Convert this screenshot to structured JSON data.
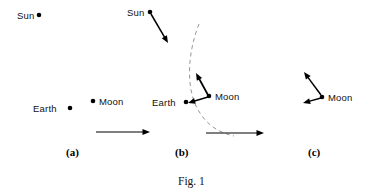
{
  "figure": {
    "caption": "Fig. 1"
  },
  "panels": [
    {
      "id": "a",
      "label": "(a)",
      "bodies": [
        {
          "name": "Sun",
          "label": "Sun",
          "label_side": "left",
          "x": 39,
          "y": 15,
          "label_x": 17,
          "label_y": 11
        },
        {
          "name": "Earth",
          "label": "Earth",
          "label_side": "left",
          "x": 70,
          "y": 108,
          "label_x": 33,
          "label_y": 104
        },
        {
          "name": "Moon",
          "label": "Moon",
          "label_side": "right",
          "x": 93,
          "y": 101,
          "label_x": 99,
          "label_y": 97
        }
      ],
      "vectors": [],
      "arc": null,
      "label_x": 66,
      "label_y": 147
    },
    {
      "id": "b",
      "label": "(b)",
      "bodies": [
        {
          "name": "Sun",
          "label": "Sun",
          "label_side": "left",
          "x": 150,
          "y": 12,
          "label_x": 127,
          "label_y": 8
        },
        {
          "name": "Earth",
          "label": "Earth",
          "label_side": "left",
          "x": 186,
          "y": 102,
          "label_x": 152,
          "label_y": 98
        },
        {
          "name": "Moon",
          "label": "Moon",
          "label_side": "right",
          "x": 209,
          "y": 96,
          "label_x": 215,
          "label_y": 92
        }
      ],
      "vectors": [
        {
          "name": "sun-force-vector",
          "x1": 151,
          "y1": 14,
          "x2": 168,
          "y2": 43,
          "width": 1.5
        },
        {
          "name": "moon-to-earth-vector",
          "x1": 208,
          "y1": 97,
          "x2": 188,
          "y2": 103,
          "width": 1.5
        },
        {
          "name": "moon-tangential-vector",
          "x1": 208,
          "y1": 95,
          "x2": 196,
          "y2": 73,
          "width": 1.7
        }
      ],
      "arc": {
        "name": "moon-orbit-arc",
        "path": "M 199,24 C 188,52 186,84 196,106 C 205,124 217,132 234,136"
      },
      "label_x": 175,
      "label_y": 147
    },
    {
      "id": "c",
      "label": "(c)",
      "bodies": [
        {
          "name": "Moon",
          "label": "Moon",
          "label_side": "right",
          "x": 322,
          "y": 97,
          "label_x": 328,
          "label_y": 93
        }
      ],
      "vectors": [
        {
          "name": "moon-tangential-vector",
          "x1": 321,
          "y1": 95,
          "x2": 304,
          "y2": 72,
          "width": 1.5
        },
        {
          "name": "moon-radial-vector",
          "x1": 321,
          "y1": 98,
          "x2": 303,
          "y2": 103,
          "width": 1.5
        }
      ],
      "arc": null,
      "label_x": 308,
      "label_y": 147
    }
  ],
  "flow_arrows": [
    {
      "name": "flow-arrow-a-to-b",
      "x1": 96,
      "y1": 132,
      "x2": 150,
      "y2": 132
    },
    {
      "name": "flow-arrow-b-to-c",
      "x1": 206,
      "y1": 133,
      "x2": 264,
      "y2": 133
    }
  ],
  "style": {
    "ink": "#000000",
    "arc_color": "#8a8a82",
    "background": "#ffffff",
    "dot_radius": 2.3
  },
  "caption_pos": {
    "x": 178,
    "y": 176
  }
}
